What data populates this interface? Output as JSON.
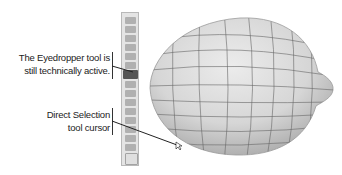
{
  "callouts": [
    {
      "line1": "The Eyedropper tool is",
      "line2": "still technically active."
    },
    {
      "line1": "Direct Selection",
      "line2": "tool cursor"
    }
  ],
  "toolbar": {
    "tools": [
      "selection",
      "direct-selection",
      "magic-wand",
      "type",
      "rectangle",
      "paintbrush",
      "eyedropper",
      "blend",
      "gradient-mesh",
      "graph",
      "artboard",
      "slice",
      "hand",
      "zoom",
      "fill-stroke",
      "swap"
    ],
    "active_tool": "eyedropper"
  },
  "artwork": {
    "subject": "lemon with gradient mesh",
    "fill_color": "#d8d8d8",
    "mesh_color": "#6a6a6a"
  }
}
